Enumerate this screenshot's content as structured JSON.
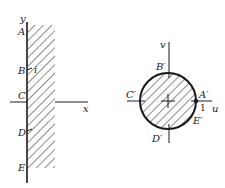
{
  "left_panel": {
    "axes": {
      "x_label": "x",
      "y_label": "y"
    },
    "points": [
      {
        "name": "A",
        "label": "A"
      },
      {
        "name": "B",
        "label": "B"
      },
      {
        "name": "C",
        "label": "C"
      },
      {
        "name": "D",
        "label": "D"
      },
      {
        "name": "E",
        "label": "E"
      }
    ],
    "tick_label": "i",
    "region": "hatched vertical strip to the right of the y-axis"
  },
  "right_panel": {
    "axes": {
      "u_label": "u",
      "v_label": "v"
    },
    "points": [
      {
        "name": "A_prime",
        "label": "A′"
      },
      {
        "name": "B_prime",
        "label": "B′"
      },
      {
        "name": "C_prime",
        "label": "C′"
      },
      {
        "name": "D_prime",
        "label": "D′"
      },
      {
        "name": "E_prime",
        "label": "E′"
      }
    ],
    "tick_label": "1",
    "region": "hatched disk"
  },
  "colors": {
    "ink": "#1a1a1a",
    "background": "#ffffff"
  }
}
